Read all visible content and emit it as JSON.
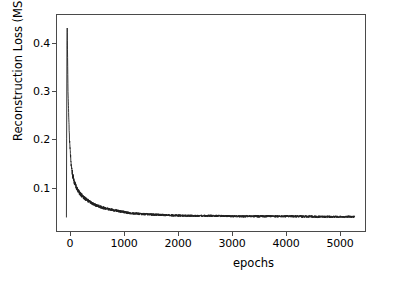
{
  "chart_data": {
    "type": "line",
    "title": "",
    "xlabel": "epochs",
    "ylabel": "Reconstruction Loss (MSE)",
    "xlim": [
      -180,
      5700
    ],
    "ylim": [
      0.0,
      0.465
    ],
    "xticks": [
      0,
      1000,
      2000,
      3000,
      4000,
      5000
    ],
    "xticklabels": [
      "0",
      "1000",
      "2000",
      "3000",
      "4000",
      "5000"
    ],
    "yticks": [
      0.1,
      0.2,
      0.3,
      0.4
    ],
    "yticklabels": [
      "0.1",
      "0.2",
      "0.3",
      "0.4"
    ],
    "grid": false,
    "legend": null,
    "line_color": "#1f1f1f",
    "line_width": 1.0,
    "series": [
      {
        "name": "Reconstruction Loss (MSE)",
        "description": "Training reconstruction loss decaying sharply from a peak of about 0.437 near epoch 0 to a noisy plateau near 0.030 by epoch 1500, continuing flat through epoch 5500.",
        "n_points": 5500,
        "peak_value": 0.437,
        "peak_epoch": 15,
        "final_value": 0.03,
        "plateau_mean": 0.031,
        "plateau_noise_amplitude": 0.006,
        "x": [
          0,
          15,
          30,
          60,
          90,
          120,
          160,
          200,
          260,
          320,
          400,
          500,
          600,
          700,
          800,
          900,
          1000,
          1200,
          1400,
          1600,
          1800,
          2000,
          2400,
          2800,
          3200,
          3600,
          4000,
          4400,
          4800,
          5200,
          5500
        ],
        "y": [
          0.437,
          0.437,
          0.3,
          0.19,
          0.14,
          0.118,
          0.1,
          0.09,
          0.079,
          0.072,
          0.065,
          0.058,
          0.053,
          0.049,
          0.046,
          0.044,
          0.042,
          0.038,
          0.036,
          0.035,
          0.034,
          0.033,
          0.032,
          0.032,
          0.031,
          0.031,
          0.031,
          0.031,
          0.03,
          0.03,
          0.03
        ]
      }
    ]
  },
  "axes": {
    "spine_color": "#4a4a4a",
    "background": "#ffffff"
  }
}
